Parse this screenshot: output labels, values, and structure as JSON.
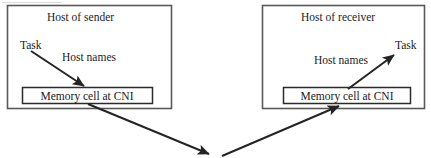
{
  "diagram": {
    "type": "block-diagram",
    "background_color": "#ffffff",
    "stroke_color": "#2b2b2b",
    "text_color": "#1c1c1c",
    "sender": {
      "title": "Host of sender",
      "task_label": "Task",
      "hostnames_label": "Host names",
      "memory_cell_label": "Memory cell at CNI"
    },
    "receiver": {
      "title": "Host of receiver",
      "task_label": "Task",
      "hostnames_label": "Host names",
      "memory_cell_label": "Memory cell at CNI"
    }
  }
}
